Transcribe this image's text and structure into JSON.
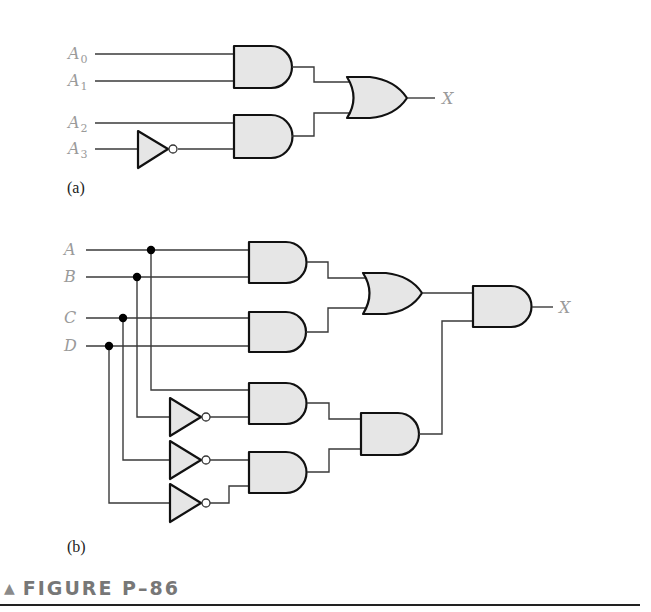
{
  "figure": {
    "caption": "FIGURE P–86",
    "caption_marker": "▲",
    "parts": [
      {
        "id": "a",
        "label": "(a)",
        "inputs": [
          {
            "name": "A",
            "sub": "0"
          },
          {
            "name": "A",
            "sub": "1"
          },
          {
            "name": "A",
            "sub": "2"
          },
          {
            "name": "A",
            "sub": "3"
          }
        ],
        "output": "X",
        "gates": [
          "AND(A0,A1)",
          "NOT(A3)",
          "AND(A2,NOT A3)",
          "OR"
        ],
        "expression": "X = A0·A1 + A2·A3'"
      },
      {
        "id": "b",
        "label": "(b)",
        "inputs": [
          {
            "name": "A"
          },
          {
            "name": "B"
          },
          {
            "name": "C"
          },
          {
            "name": "D"
          }
        ],
        "output": "X",
        "gates": [
          "AND(A,B)",
          "AND(C,D)",
          "OR",
          "NOT(B)",
          "NOT(C)",
          "NOT(D)",
          "AND(A,B')",
          "AND(C',D')",
          "AND",
          "AND(final)"
        ],
        "expression": "X = (AB + CD)(AB' + C'D')"
      }
    ]
  },
  "colors": {
    "gate_fill": "#e6e6e6",
    "gate_stroke": "#111111",
    "wire": "#3a3a3a",
    "label": "#9a9a9a",
    "caption": "#777777"
  }
}
